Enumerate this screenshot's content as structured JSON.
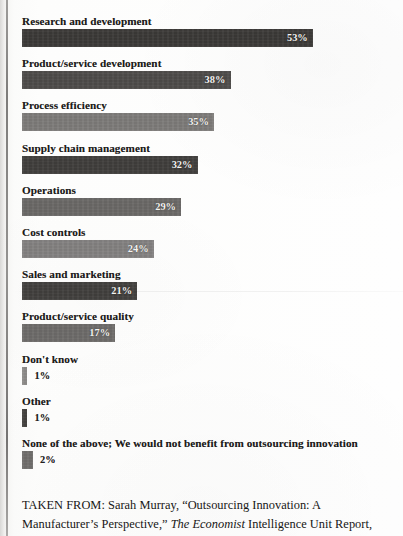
{
  "chart_data": {
    "type": "bar",
    "orientation": "horizontal",
    "title": "",
    "subtitle": "",
    "xlabel": "",
    "ylabel": "",
    "xlim": [
      0,
      55
    ],
    "grid": false,
    "legend": null,
    "value_suffix": "%",
    "categories": [
      "Research and development",
      "Product/service development",
      "Process efficiency",
      "Supply chain management",
      "Operations",
      "Cost controls",
      "Sales and marketing",
      "Product/service quality",
      "Don't know",
      "Other",
      "None of the above; We would not benefit from outsourcing innovation"
    ],
    "values": [
      53,
      38,
      35,
      32,
      29,
      24,
      21,
      17,
      1,
      1,
      2
    ],
    "value_labels": [
      "53%",
      "38%",
      "35%",
      "32%",
      "29%",
      "24%",
      "21%",
      "17%",
      "1%",
      "1%",
      "2%"
    ],
    "bar_colors": [
      "#3b3937",
      "#4d4b49",
      "#7d7b79",
      "#403e3c",
      "#6a6866",
      "#838180",
      "#413f3d",
      "#6d6b69",
      "#8b8987",
      "#3f3d3b",
      "#6f6d6b"
    ]
  },
  "bars": [
    {
      "label": "Research and development",
      "value_label": "53%"
    },
    {
      "label": "Product/service development",
      "value_label": "38%"
    },
    {
      "label": "Process efficiency",
      "value_label": "35%"
    },
    {
      "label": "Supply chain management",
      "value_label": "32%"
    },
    {
      "label": "Operations",
      "value_label": "29%"
    },
    {
      "label": "Cost controls",
      "value_label": "24%"
    },
    {
      "label": "Sales and marketing",
      "value_label": "21%"
    },
    {
      "label": "Product/service quality",
      "value_label": "17%"
    },
    {
      "label": "Don't know",
      "value_label": "1%"
    },
    {
      "label": "Other",
      "value_label": "1%"
    },
    {
      "label": "None of the above; We would not benefit from outsourcing innovation",
      "value_label": "2%"
    }
  ],
  "citation": {
    "prefix": "TAKEN FROM: Sarah Murray, “Outsourcing Innovation: A Manufacturer’s Perspective,” ",
    "italic": "The Economist",
    "suffix": " Intelligence Unit Report,"
  }
}
